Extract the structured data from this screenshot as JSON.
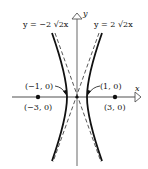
{
  "diagram": {
    "type": "hyperbola-graph",
    "equation_hint": "x^2 - y^2/8 = 1",
    "axes": {
      "x_label": "x",
      "y_label": "y"
    },
    "asymptotes": [
      {
        "label": "y = −2 √2x",
        "slope": "-2√2"
      },
      {
        "label": "y = 2 √2x",
        "slope": "2√2"
      }
    ],
    "points": [
      {
        "label": "(−1, 0)",
        "role": "vertex"
      },
      {
        "label": "(1, 0)",
        "role": "vertex"
      },
      {
        "label": "(−3, 0)",
        "role": "focus"
      },
      {
        "label": "(3, 0)",
        "role": "focus"
      }
    ],
    "colors": {
      "curve": "#111111",
      "axis": "#888888",
      "asymptote": "#444444"
    }
  }
}
